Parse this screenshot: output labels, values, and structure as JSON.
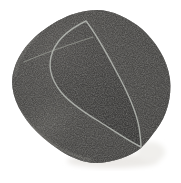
{
  "image": {
    "description": "Grayscale product photo of a cylindrical abrasive sanding drum sleeve, viewed at an angle, centered on a plain white background",
    "object": "textured dark gray cylinder",
    "features": [
      "granular sandpaper-like surface texture",
      "light thin rim line outlining the tilted circular face",
      "faint light seam line near the upper-left edge",
      "very soft shadow at lower right"
    ]
  },
  "colors": {
    "background": "#ffffff",
    "body_gray": "#4b4a48",
    "body_light_gray": "#585654",
    "face_interior_shade": "rgba(8,8,10,0.13)",
    "rim_highlight": "#b9bcb6",
    "seam_highlight": "#abaea6",
    "edge_sheen": "rgba(190,188,180,0.30)",
    "drop_shadow": "#ebe9e6"
  }
}
